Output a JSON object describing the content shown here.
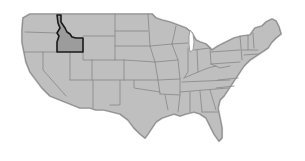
{
  "map": {
    "title": "United States map",
    "highlighted_state": "Idaho",
    "colors": {
      "land": "#bfbfbf",
      "borders": "#8c8c8c",
      "highlight_fill": "#9c9c9c",
      "highlight_stroke": "#1a1a1a",
      "background": "#ffffff"
    }
  }
}
